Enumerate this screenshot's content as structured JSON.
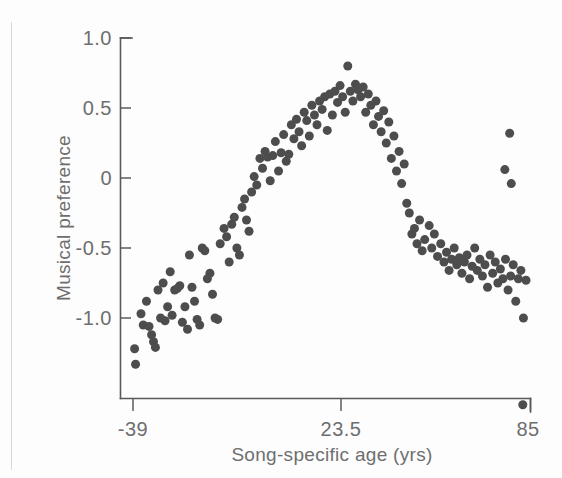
{
  "figure": {
    "background_color": "#fdfdfd",
    "marker_color": "#4d4d4d",
    "axis_color": "#5a5a5a",
    "text_color": "#6e6e6e"
  },
  "axes": {
    "y_title": "Musical preference",
    "x_title": "Song-specific age (yrs)",
    "y_ticks": [
      "1.0",
      "0.5",
      "0",
      "-0.5",
      "-1.0"
    ],
    "x_ticks": [
      "-39",
      "23.5",
      "85"
    ]
  },
  "chart_data": {
    "type": "scatter",
    "title": "",
    "xlabel": "Song-specific age (yrs)",
    "ylabel": "Musical preference",
    "xlim": [
      -39,
      85
    ],
    "ylim": [
      -1.75,
      1.1
    ],
    "grid": false,
    "legend": "none",
    "xticks": [
      -39,
      23.5,
      85
    ],
    "xticklabels": [
      "-39",
      "23.5",
      "85"
    ],
    "yticks": [
      1.0,
      0.5,
      0,
      -0.5,
      -1.0
    ],
    "yticklabels": [
      "1.0",
      "0.5",
      "0",
      "-0.5",
      "-1.0"
    ],
    "marker": "circle",
    "marker_size_px": 9,
    "points": [
      [
        -38.5,
        -1.22
      ],
      [
        -38.2,
        -1.33
      ],
      [
        -36.5,
        -0.97
      ],
      [
        -35.8,
        -1.05
      ],
      [
        -34.8,
        -0.88
      ],
      [
        -34.0,
        -1.06
      ],
      [
        -33.2,
        -1.12
      ],
      [
        -32.6,
        -1.17
      ],
      [
        -32.0,
        -1.21
      ],
      [
        -31.2,
        -0.8
      ],
      [
        -30.4,
        -1.0
      ],
      [
        -29.6,
        -0.75
      ],
      [
        -29.0,
        -1.02
      ],
      [
        -28.2,
        -0.92
      ],
      [
        -27.4,
        -0.67
      ],
      [
        -26.8,
        -0.98
      ],
      [
        -26.0,
        -0.8
      ],
      [
        -25.2,
        -0.79
      ],
      [
        -24.4,
        -0.77
      ],
      [
        -23.6,
        -1.03
      ],
      [
        -22.8,
        -0.92
      ],
      [
        -22.0,
        -1.08
      ],
      [
        -21.4,
        -0.55
      ],
      [
        -20.6,
        -0.78
      ],
      [
        -19.8,
        -0.88
      ],
      [
        -19.0,
        -1.01
      ],
      [
        -18.2,
        -1.05
      ],
      [
        -17.4,
        -0.5
      ],
      [
        -16.6,
        -0.52
      ],
      [
        -15.8,
        -0.72
      ],
      [
        -15.0,
        -0.68
      ],
      [
        -14.2,
        -0.83
      ],
      [
        -13.4,
        -1.0
      ],
      [
        -12.6,
        -1.01
      ],
      [
        -11.8,
        -0.47
      ],
      [
        -10.6,
        -0.36
      ],
      [
        -9.8,
        -0.42
      ],
      [
        -9.0,
        -0.6
      ],
      [
        -8.2,
        -0.33
      ],
      [
        -7.4,
        -0.28
      ],
      [
        -6.6,
        -0.5
      ],
      [
        -5.8,
        -0.55
      ],
      [
        -5.0,
        -0.21
      ],
      [
        -4.2,
        -0.15
      ],
      [
        -3.6,
        -0.3
      ],
      [
        -2.8,
        -0.38
      ],
      [
        -2.0,
        -0.1
      ],
      [
        -1.2,
        0.01
      ],
      [
        -0.4,
        -0.05
      ],
      [
        0.6,
        0.14
      ],
      [
        1.4,
        0.07
      ],
      [
        2.2,
        0.19
      ],
      [
        3.0,
        0.15
      ],
      [
        3.8,
        -0.02
      ],
      [
        4.6,
        0.16
      ],
      [
        5.4,
        0.26
      ],
      [
        6.4,
        0.05
      ],
      [
        7.2,
        0.18
      ],
      [
        8.0,
        0.31
      ],
      [
        8.8,
        0.12
      ],
      [
        9.6,
        0.17
      ],
      [
        10.4,
        0.38
      ],
      [
        11.2,
        0.28
      ],
      [
        12.0,
        0.42
      ],
      [
        12.8,
        0.33
      ],
      [
        13.6,
        0.23
      ],
      [
        14.4,
        0.47
      ],
      [
        15.2,
        0.41
      ],
      [
        16.0,
        0.3
      ],
      [
        16.8,
        0.52
      ],
      [
        17.6,
        0.45
      ],
      [
        18.4,
        0.38
      ],
      [
        19.2,
        0.55
      ],
      [
        20.0,
        0.49
      ],
      [
        20.8,
        0.58
      ],
      [
        21.6,
        0.34
      ],
      [
        22.4,
        0.6
      ],
      [
        23.2,
        0.45
      ],
      [
        24.0,
        0.62
      ],
      [
        24.8,
        0.54
      ],
      [
        25.6,
        0.66
      ],
      [
        26.4,
        0.58
      ],
      [
        27.2,
        0.47
      ],
      [
        28.0,
        0.8
      ],
      [
        28.8,
        0.62
      ],
      [
        29.6,
        0.55
      ],
      [
        30.4,
        0.67
      ],
      [
        31.2,
        0.63
      ],
      [
        32.0,
        0.58
      ],
      [
        32.8,
        0.65
      ],
      [
        33.6,
        0.47
      ],
      [
        34.4,
        0.6
      ],
      [
        35.2,
        0.52
      ],
      [
        36.0,
        0.38
      ],
      [
        36.8,
        0.55
      ],
      [
        37.6,
        0.44
      ],
      [
        38.4,
        0.33
      ],
      [
        39.2,
        0.48
      ],
      [
        40.0,
        0.25
      ],
      [
        40.8,
        0.4
      ],
      [
        41.6,
        0.14
      ],
      [
        42.4,
        0.3
      ],
      [
        43.2,
        0.05
      ],
      [
        44.0,
        0.19
      ],
      [
        44.8,
        -0.04
      ],
      [
        45.6,
        0.1
      ],
      [
        46.4,
        -0.18
      ],
      [
        47.2,
        -0.25
      ],
      [
        48.0,
        -0.4
      ],
      [
        48.8,
        -0.36
      ],
      [
        49.6,
        -0.47
      ],
      [
        50.4,
        -0.3
      ],
      [
        51.2,
        -0.52
      ],
      [
        52.0,
        -0.44
      ],
      [
        53.4,
        -0.34
      ],
      [
        54.2,
        -0.5
      ],
      [
        55.0,
        -0.4
      ],
      [
        56.0,
        -0.56
      ],
      [
        57.0,
        -0.47
      ],
      [
        58.0,
        -0.6
      ],
      [
        58.8,
        -0.53
      ],
      [
        59.6,
        -0.66
      ],
      [
        60.4,
        -0.58
      ],
      [
        61.2,
        -0.5
      ],
      [
        62.0,
        -0.62
      ],
      [
        62.8,
        -0.57
      ],
      [
        63.6,
        -0.68
      ],
      [
        64.4,
        -0.6
      ],
      [
        65.2,
        -0.55
      ],
      [
        66.0,
        -0.72
      ],
      [
        66.8,
        -0.63
      ],
      [
        67.6,
        -0.5
      ],
      [
        68.4,
        -0.66
      ],
      [
        69.2,
        -0.58
      ],
      [
        70.0,
        -0.7
      ],
      [
        70.8,
        -0.62
      ],
      [
        71.6,
        -0.78
      ],
      [
        72.4,
        -0.55
      ],
      [
        73.2,
        -0.68
      ],
      [
        74.0,
        -0.6
      ],
      [
        74.8,
        -0.75
      ],
      [
        75.6,
        -0.65
      ],
      [
        76.4,
        -0.72
      ],
      [
        77.2,
        -0.58
      ],
      [
        78.0,
        -0.8
      ],
      [
        78.8,
        -0.7
      ],
      [
        79.6,
        -0.62
      ],
      [
        80.4,
        -0.88
      ],
      [
        81.2,
        -0.72
      ],
      [
        82.0,
        -0.66
      ],
      [
        82.8,
        -1.0
      ],
      [
        83.6,
        -0.73
      ],
      [
        78.5,
        0.32
      ],
      [
        77.0,
        0.06
      ],
      [
        79.0,
        -0.04
      ],
      [
        82.6,
        -1.62
      ]
    ]
  }
}
